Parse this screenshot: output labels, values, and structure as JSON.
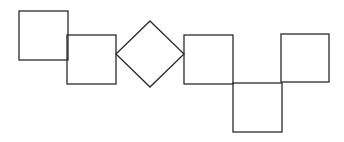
{
  "diagram": {
    "width": 344,
    "height": 142,
    "background": "#ffffff",
    "stroke_color": "#2a2a2a",
    "stroke_width": 1.3,
    "shapes": [
      {
        "id": "square-1",
        "type": "square",
        "x": 19,
        "y": 11,
        "size": 49
      },
      {
        "id": "square-2",
        "type": "square",
        "x": 67,
        "y": 35,
        "size": 49
      },
      {
        "id": "diamond-1",
        "type": "diamond",
        "cx": 150,
        "cy": 54,
        "half_w": 34,
        "half_h": 33
      },
      {
        "id": "square-3",
        "type": "square",
        "x": 184,
        "y": 35,
        "size": 49
      },
      {
        "id": "square-4",
        "type": "square",
        "x": 233,
        "y": 83,
        "size": 49
      },
      {
        "id": "square-5",
        "type": "square",
        "x": 281,
        "y": 34,
        "size": 48
      }
    ]
  }
}
